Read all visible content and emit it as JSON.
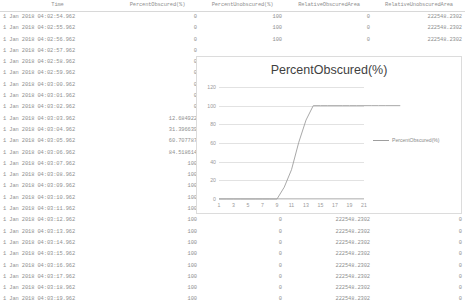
{
  "table": {
    "columns": [
      {
        "key": "time",
        "label": "Time"
      },
      {
        "key": "percent_obscured",
        "label": "PercentObscured(%)"
      },
      {
        "key": "percent_unobscured",
        "label": "PercentUnobscured(%)"
      },
      {
        "key": "relative_obscured_area",
        "label": "RelativeObscuredArea"
      },
      {
        "key": "relative_unobscured_area",
        "label": "RelativeUnobscuredArea"
      }
    ],
    "rows": [
      {
        "time": "1 Jan 2018 04:02:54.962",
        "percent_obscured": "0",
        "percent_unobscured": "100",
        "relative_obscured_area": "0",
        "relative_unobscured_area": "222548.2302"
      },
      {
        "time": "1 Jan 2018 04:02:55.962",
        "percent_obscured": "0",
        "percent_unobscured": "100",
        "relative_obscured_area": "0",
        "relative_unobscured_area": "222548.2302"
      },
      {
        "time": "1 Jan 2018 04:02:56.962",
        "percent_obscured": "0",
        "percent_unobscured": "100",
        "relative_obscured_area": "0",
        "relative_unobscured_area": "222548.2302"
      },
      {
        "time": "1 Jan 2018 04:02:57.962",
        "percent_obscured": "0",
        "percent_unobscured": "",
        "relative_obscured_area": "",
        "relative_unobscured_area": ""
      },
      {
        "time": "1 Jan 2018 04:02:58.962",
        "percent_obscured": "0",
        "percent_unobscured": "",
        "relative_obscured_area": "",
        "relative_unobscured_area": ""
      },
      {
        "time": "1 Jan 2018 04:02:59.962",
        "percent_obscured": "0",
        "percent_unobscured": "",
        "relative_obscured_area": "",
        "relative_unobscured_area": ""
      },
      {
        "time": "1 Jan 2018 04:03:00.962",
        "percent_obscured": "0",
        "percent_unobscured": "",
        "relative_obscured_area": "",
        "relative_unobscured_area": ""
      },
      {
        "time": "1 Jan 2018 04:03:01.962",
        "percent_obscured": "0",
        "percent_unobscured": "",
        "relative_obscured_area": "",
        "relative_unobscured_area": ""
      },
      {
        "time": "1 Jan 2018 04:03:02.962",
        "percent_obscured": "0",
        "percent_unobscured": "",
        "relative_obscured_area": "",
        "relative_unobscured_area": ""
      },
      {
        "time": "1 Jan 2018 04:03:03.962",
        "percent_obscured": "12.684922",
        "percent_unobscured": "",
        "relative_obscured_area": "",
        "relative_unobscured_area": ""
      },
      {
        "time": "1 Jan 2018 04:03:04.962",
        "percent_obscured": "31.396639",
        "percent_unobscured": "",
        "relative_obscured_area": "",
        "relative_unobscured_area": ""
      },
      {
        "time": "1 Jan 2018 04:03:05.962",
        "percent_obscured": "60.707787",
        "percent_unobscured": "",
        "relative_obscured_area": "",
        "relative_unobscured_area": ""
      },
      {
        "time": "1 Jan 2018 04:03:06.962",
        "percent_obscured": "84.518614",
        "percent_unobscured": "",
        "relative_obscured_area": "",
        "relative_unobscured_area": ""
      },
      {
        "time": "1 Jan 2018 04:03:07.962",
        "percent_obscured": "100",
        "percent_unobscured": "",
        "relative_obscured_area": "",
        "relative_unobscured_area": ""
      },
      {
        "time": "1 Jan 2018 04:03:08.962",
        "percent_obscured": "100",
        "percent_unobscured": "",
        "relative_obscured_area": "",
        "relative_unobscured_area": ""
      },
      {
        "time": "1 Jan 2018 04:03:09.962",
        "percent_obscured": "100",
        "percent_unobscured": "",
        "relative_obscured_area": "",
        "relative_unobscured_area": ""
      },
      {
        "time": "1 Jan 2018 04:03:10.962",
        "percent_obscured": "100",
        "percent_unobscured": "",
        "relative_obscured_area": "",
        "relative_unobscured_area": ""
      },
      {
        "time": "1 Jan 2018 04:03:11.962",
        "percent_obscured": "100",
        "percent_unobscured": "",
        "relative_obscured_area": "",
        "relative_unobscured_area": ""
      },
      {
        "time": "1 Jan 2018 04:03:12.962",
        "percent_obscured": "100",
        "percent_unobscured": "0",
        "relative_obscured_area": "222548.2302",
        "relative_unobscured_area": "0"
      },
      {
        "time": "1 Jan 2018 04:03:13.962",
        "percent_obscured": "100",
        "percent_unobscured": "0",
        "relative_obscured_area": "222548.2302",
        "relative_unobscured_area": "0"
      },
      {
        "time": "1 Jan 2018 04:03:14.962",
        "percent_obscured": "100",
        "percent_unobscured": "0",
        "relative_obscured_area": "222548.2302",
        "relative_unobscured_area": "0"
      },
      {
        "time": "1 Jan 2018 04:03:15.962",
        "percent_obscured": "100",
        "percent_unobscured": "0",
        "relative_obscured_area": "222548.2302",
        "relative_unobscured_area": "0"
      },
      {
        "time": "1 Jan 2018 04:03:16.962",
        "percent_obscured": "100",
        "percent_unobscured": "0",
        "relative_obscured_area": "222548.2302",
        "relative_unobscured_area": "0"
      },
      {
        "time": "1 Jan 2018 04:03:17.962",
        "percent_obscured": "100",
        "percent_unobscured": "0",
        "relative_obscured_area": "222548.2302",
        "relative_unobscured_area": "0"
      },
      {
        "time": "1 Jan 2018 04:03:18.962",
        "percent_obscured": "100",
        "percent_unobscured": "0",
        "relative_obscured_area": "222548.2302",
        "relative_unobscured_area": "0"
      },
      {
        "time": "1 Jan 2018 04:03:19.962",
        "percent_obscured": "100",
        "percent_unobscured": "0",
        "relative_obscured_area": "222548.2302",
        "relative_unobscured_area": "0"
      }
    ]
  },
  "chart_data": {
    "type": "line",
    "title": "PercentObscured(%)",
    "xlabel": "",
    "ylabel": "",
    "grid": true,
    "legend_position": "right",
    "legend": [
      "PercentObscured(%)"
    ],
    "line_color": "#9e9e9e",
    "ylim": [
      0,
      120
    ],
    "yticks": [
      0,
      20,
      40,
      60,
      80,
      100,
      120
    ],
    "xlim": [
      1,
      21
    ],
    "xticks": [
      1,
      3,
      5,
      7,
      9,
      11,
      13,
      15,
      17,
      19,
      21
    ],
    "x": [
      1,
      2,
      3,
      4,
      5,
      6,
      7,
      8,
      9,
      10,
      11,
      12,
      13,
      14,
      15,
      16,
      17,
      18,
      19,
      20,
      21,
      22,
      23,
      24,
      25,
      26
    ],
    "series": [
      {
        "name": "PercentObscured(%)",
        "values": [
          0,
          0,
          0,
          0,
          0,
          0,
          0,
          0,
          0,
          12.684922,
          31.396639,
          60.707787,
          84.518614,
          100,
          100,
          100,
          100,
          100,
          100,
          100,
          100,
          100,
          100,
          100,
          100,
          100
        ]
      }
    ]
  }
}
